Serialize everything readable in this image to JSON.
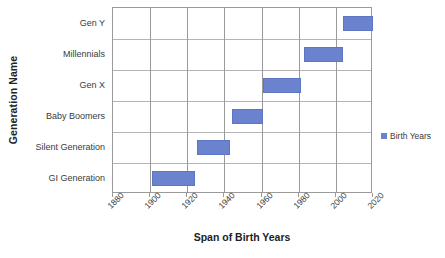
{
  "chart_data": {
    "type": "bar",
    "orientation": "horizontal-range",
    "title": "",
    "xlabel": "Span of Birth Years",
    "ylabel": "Generation Name",
    "xlim": [
      1880,
      2020
    ],
    "xticks": [
      "1880",
      "1900",
      "1920",
      "1940",
      "1960",
      "1980",
      "2000",
      "2020"
    ],
    "xtick_values": [
      1880,
      1900,
      1920,
      1940,
      1960,
      1980,
      2000,
      2020
    ],
    "grid": true,
    "legend_position": "right",
    "series": [
      {
        "name": "Birth Years",
        "color": "#6b83ce"
      }
    ],
    "categories": [
      "Gen Y",
      "Millennials",
      "Gen X",
      "Baby Boomers",
      "Silent Generation",
      "GI Generation"
    ],
    "bars": [
      {
        "category": "Gen Y",
        "start": 2004,
        "end": 2020
      },
      {
        "category": "Millennials",
        "start": 1983,
        "end": 2004
      },
      {
        "category": "Gen X",
        "start": 1961,
        "end": 1981
      },
      {
        "category": "Baby Boomers",
        "start": 1944,
        "end": 1961
      },
      {
        "category": "Silent Generation",
        "start": 1925,
        "end": 1943
      },
      {
        "category": "GI Generation",
        "start": 1901,
        "end": 1924
      }
    ]
  },
  "legend": {
    "items": [
      {
        "label": "Birth Years",
        "color": "#6b83ce"
      }
    ]
  },
  "colors": {
    "bar": "#6b83ce",
    "bar_border": "#5d76c4",
    "axis_line": "#9a9a9a",
    "grid_line": "#b3b3b3",
    "text": "#3b3b3b",
    "title_text": "#222222",
    "background": "#ffffff"
  }
}
